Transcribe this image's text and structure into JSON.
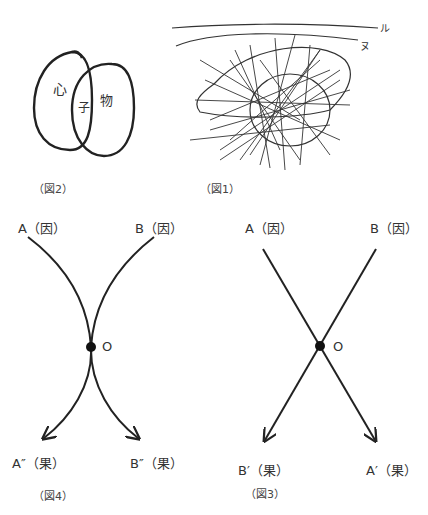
{
  "figures": {
    "fig2": {
      "caption": "（図2）",
      "left_oval_label": "心",
      "overlap_label": "子",
      "right_oval_label": "物"
    },
    "fig1": {
      "caption": "（図1）",
      "top_line_label": "ル",
      "second_line_label": "ヌ",
      "marks": [
        "イ",
        "ロ",
        "ハ",
        "ニ",
        "ホ",
        "ヘ",
        "ト",
        "チ",
        "リ"
      ]
    },
    "fig4": {
      "caption": "（図4）",
      "top_left": "A（因）",
      "top_right": "B（因）",
      "center": "O",
      "bottom_left": "A″（果）",
      "bottom_right": "B″（果）"
    },
    "fig3": {
      "caption": "（図3）",
      "top_left": "A（因）",
      "top_right": "B（因）",
      "center": "O",
      "bottom_left": "B′（果）",
      "bottom_right": "A′（果）"
    }
  },
  "colors": {
    "line": "#222222",
    "text": "#333333"
  }
}
